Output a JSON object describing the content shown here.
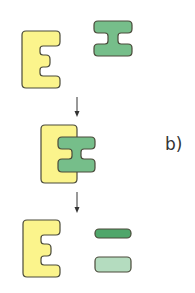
{
  "diagram": {
    "panel_label": "b)",
    "stages": [
      {
        "name": "separate",
        "description": "enzyme and substrate apart"
      },
      {
        "name": "complex",
        "description": "enzyme-substrate complex"
      },
      {
        "name": "products",
        "description": "enzyme and two product pieces"
      }
    ],
    "colors": {
      "enzyme_fill": "#fbf48c",
      "substrate_fill": "#76be8a",
      "product_dark_fill": "#4fa66a",
      "product_light_fill": "#b4dcbf",
      "outline": "#4a4a3a",
      "arrow": "#333333"
    }
  }
}
